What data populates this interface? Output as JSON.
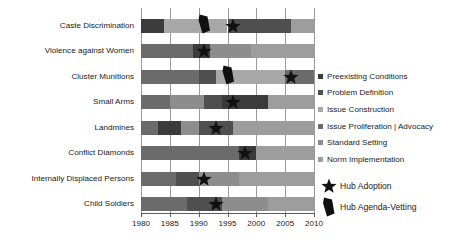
{
  "chart_data": {
    "type": "bar",
    "orientation": "horizontal",
    "subtype": "stacked-timeline",
    "title": "",
    "xlabel": "",
    "ylabel": "",
    "xlim": [
      1980,
      2010
    ],
    "xticks": [
      1980,
      1985,
      1990,
      1995,
      2000,
      2005,
      2010
    ],
    "xtick_labels": [
      "1980",
      "1985",
      "1990",
      "1995",
      "2000",
      "2005",
      "2010"
    ],
    "grid": true,
    "legend_position": "right",
    "categories": [
      "Caste Discrimination",
      "Violence against Women",
      "Cluster Munitions",
      "Small Arms",
      "Landmines",
      "Conflict Diamonds",
      "Internally Displaced Persons",
      "Child Soldiers"
    ],
    "series": [
      {
        "name": "Preexisting Conditions",
        "color": "#3b3b3b"
      },
      {
        "name": "Problem Definition",
        "color": "#4f4f4f"
      },
      {
        "name": "Issue Construction",
        "color": "#a8a8a8"
      },
      {
        "name": "Issue Proliferation | Advocacy",
        "color": "#6b6b6b"
      },
      {
        "name": "Standard Setting",
        "color": "#8d8d8d"
      },
      {
        "name": "Norm Implementation",
        "color": "#9d9d9d"
      }
    ],
    "rows": [
      {
        "category": "Caste Discrimination",
        "segments": [
          {
            "series": "Preexisting Conditions",
            "start": 1980,
            "end": 1984,
            "color": "#3b3b3b"
          },
          {
            "series": "Issue Construction",
            "start": 1984,
            "end": 1995,
            "color": "#a8a8a8"
          },
          {
            "series": "Issue Proliferation | Advocacy",
            "start": 1995,
            "end": 2006,
            "color": "#4f4f4f"
          },
          {
            "series": "Norm Implementation",
            "start": 2006,
            "end": 2010,
            "color": "#9d9d9d"
          }
        ],
        "markers": [
          {
            "type": "Hub Agenda-Vetting",
            "year": 1991
          },
          {
            "type": "Hub Adoption",
            "year": 1996
          }
        ]
      },
      {
        "category": "Violence against Women",
        "segments": [
          {
            "series": "Preexisting Conditions",
            "start": 1980,
            "end": 1989,
            "color": "#6b6b6b"
          },
          {
            "series": "Problem Definition",
            "start": 1989,
            "end": 1992,
            "color": "#3b3b3b"
          },
          {
            "series": "Issue Construction",
            "start": 1992,
            "end": 1999,
            "color": "#8d8d8d"
          },
          {
            "series": "Standard Setting",
            "start": 1999,
            "end": 2010,
            "color": "#9d9d9d"
          }
        ],
        "markers": [
          {
            "type": "Hub Adoption",
            "year": 1991
          }
        ]
      },
      {
        "category": "Cluster Munitions",
        "segments": [
          {
            "series": "Preexisting Conditions",
            "start": 1980,
            "end": 1990,
            "color": "#6b6b6b"
          },
          {
            "series": "Problem Definition",
            "start": 1990,
            "end": 1993,
            "color": "#4f4f4f"
          },
          {
            "series": "Issue Construction",
            "start": 1993,
            "end": 2005,
            "color": "#a8a8a8"
          },
          {
            "series": "Standard Setting",
            "start": 2005,
            "end": 2010,
            "color": "#6b6b6b"
          }
        ],
        "markers": [
          {
            "type": "Hub Agenda-Vetting",
            "year": 1995
          },
          {
            "type": "Hub Adoption",
            "year": 2006
          }
        ]
      },
      {
        "category": "Small Arms",
        "segments": [
          {
            "series": "Preexisting Conditions",
            "start": 1980,
            "end": 1985,
            "color": "#6b6b6b"
          },
          {
            "series": "Problem Definition",
            "start": 1985,
            "end": 1991,
            "color": "#8d8d8d"
          },
          {
            "series": "Issue Construction",
            "start": 1991,
            "end": 1994,
            "color": "#4f4f4f"
          },
          {
            "series": "Issue Proliferation | Advocacy",
            "start": 1994,
            "end": 2002,
            "color": "#3b3b3b"
          },
          {
            "series": "Norm Implementation",
            "start": 2002,
            "end": 2010,
            "color": "#9d9d9d"
          }
        ],
        "markers": [
          {
            "type": "Hub Adoption",
            "year": 1996
          }
        ]
      },
      {
        "category": "Landmines",
        "segments": [
          {
            "series": "Preexisting Conditions",
            "start": 1980,
            "end": 1983,
            "color": "#6b6b6b"
          },
          {
            "series": "Problem Definition",
            "start": 1983,
            "end": 1987,
            "color": "#3b3b3b"
          },
          {
            "series": "Issue Construction",
            "start": 1987,
            "end": 1990,
            "color": "#8d8d8d"
          },
          {
            "series": "Issue Proliferation | Advocacy",
            "start": 1990,
            "end": 1996,
            "color": "#4f4f4f"
          },
          {
            "series": "Norm Implementation",
            "start": 1996,
            "end": 2010,
            "color": "#9d9d9d"
          }
        ],
        "markers": [
          {
            "type": "Hub Adoption",
            "year": 1993
          }
        ]
      },
      {
        "category": "Conflict Diamonds",
        "segments": [
          {
            "series": "Preexisting Conditions",
            "start": 1980,
            "end": 1997,
            "color": "#6b6b6b"
          },
          {
            "series": "Problem Definition",
            "start": 1997,
            "end": 2000,
            "color": "#3b3b3b"
          },
          {
            "series": "Issue Construction",
            "start": 2000,
            "end": 2010,
            "color": "#9d9d9d"
          }
        ],
        "markers": [
          {
            "type": "Hub Adoption",
            "year": 1998
          }
        ]
      },
      {
        "category": "Internally Displaced Persons",
        "segments": [
          {
            "series": "Preexisting Conditions",
            "start": 1980,
            "end": 1986,
            "color": "#6b6b6b"
          },
          {
            "series": "Problem Definition",
            "start": 1986,
            "end": 1990,
            "color": "#4f4f4f"
          },
          {
            "series": "Issue Construction",
            "start": 1990,
            "end": 1997,
            "color": "#8d8d8d"
          },
          {
            "series": "Norm Implementation",
            "start": 1997,
            "end": 2010,
            "color": "#9d9d9d"
          }
        ],
        "markers": [
          {
            "type": "Hub Adoption",
            "year": 1991
          }
        ]
      },
      {
        "category": "Child Soldiers",
        "segments": [
          {
            "series": "Preexisting Conditions",
            "start": 1980,
            "end": 1988,
            "color": "#6b6b6b"
          },
          {
            "series": "Problem Definition",
            "start": 1988,
            "end": 1994,
            "color": "#4f4f4f"
          },
          {
            "series": "Issue Construction",
            "start": 1994,
            "end": 2002,
            "color": "#8d8d8d"
          },
          {
            "series": "Norm Implementation",
            "start": 2002,
            "end": 2010,
            "color": "#9d9d9d"
          }
        ],
        "markers": [
          {
            "type": "Hub Adoption",
            "year": 1993
          }
        ]
      }
    ],
    "marker_legend": [
      {
        "name": "Hub Adoption",
        "glyph": "star",
        "color": "#111111"
      },
      {
        "name": "Hub Agenda-Vetting",
        "glyph": "agenda-vetting-wedge",
        "color": "#111111"
      }
    ]
  }
}
